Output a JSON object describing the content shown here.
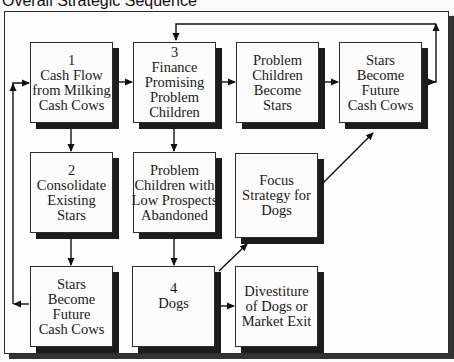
{
  "title": "Overall Strategic Sequence",
  "boxes": {
    "b1": {
      "lines": [
        "1",
        "Cash Flow",
        "from Milking",
        "Cash Cows"
      ]
    },
    "b3": {
      "lines": [
        "3",
        "Finance",
        "Promising",
        "Problem",
        "Children"
      ]
    },
    "pcbs": {
      "lines": [
        "Problem",
        "Children",
        "Become",
        "Stars"
      ]
    },
    "sbfcc_top": {
      "lines": [
        "Stars",
        "Become",
        "Future",
        "Cash Cows"
      ]
    },
    "b2": {
      "lines": [
        "2",
        "Consolidate",
        "Existing",
        "Stars"
      ]
    },
    "pclp": {
      "lines": [
        "Problem",
        "Children with",
        "Low Prospects",
        "Abandoned"
      ]
    },
    "focus": {
      "lines": [
        "Focus",
        "Strategy for",
        "Dogs"
      ]
    },
    "sbfcc_bottom": {
      "lines": [
        "Stars",
        "Become",
        "Future",
        "Cash Cows"
      ]
    },
    "b4": {
      "lines": [
        "4",
        "Dogs"
      ]
    },
    "divest": {
      "lines": [
        "Divestiture",
        "of Dogs or",
        "Market Exit"
      ]
    }
  },
  "connections": [
    {
      "from": "b1",
      "to": "b3"
    },
    {
      "from": "b3",
      "to": "pcbs"
    },
    {
      "from": "pcbs",
      "to": "sbfcc_top"
    },
    {
      "from": "sbfcc_top",
      "to": "b3",
      "via": "top feedback loop"
    },
    {
      "from": "b1",
      "to": "b2"
    },
    {
      "from": "b2",
      "to": "sbfcc_bottom"
    },
    {
      "from": "sbfcc_bottom",
      "to": "b1",
      "via": "left feedback loop"
    },
    {
      "from": "b3",
      "to": "pclp"
    },
    {
      "from": "pclp",
      "to": "b4"
    },
    {
      "from": "b4",
      "to": "focus"
    },
    {
      "from": "focus",
      "to": "sbfcc_top"
    },
    {
      "from": "b4",
      "to": "divest"
    }
  ]
}
